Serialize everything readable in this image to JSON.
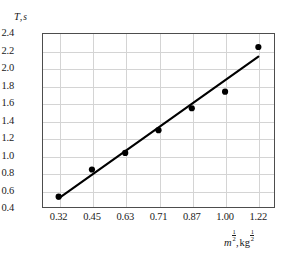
{
  "chart_data": {
    "type": "scatter",
    "title": "",
    "subtitle": "",
    "xlabel": "m^1/2, kg^1/2",
    "ylabel": "T, s",
    "ylabel_parts": {
      "variable": "T",
      "separator": ",",
      "unit": "s"
    },
    "xlabel_parts": {
      "variable": "m",
      "variable_exponent_num": "1",
      "variable_exponent_den": "2",
      "separator": ",",
      "unit": "kg",
      "unit_exponent_num": "1",
      "unit_exponent_den": "2"
    },
    "x": [
      0.32,
      0.45,
      0.63,
      0.71,
      0.87,
      1.0,
      1.22
    ],
    "values": [
      0.53,
      0.84,
      1.03,
      1.29,
      1.54,
      1.73,
      2.24
    ],
    "categories": [
      "0.32",
      "0.45",
      "0.63",
      "0.71",
      "0.87",
      "1.00",
      "1.22"
    ],
    "xtick_labels": [
      "0.32",
      "0.45",
      "0.63",
      "0.71",
      "0.87",
      "1.00",
      "1.22"
    ],
    "ytick_labels": [
      "2.4",
      "2.2",
      "2.0",
      "1.8",
      "1.6",
      "1.4",
      "1.2",
      "1.0",
      "0.8",
      "0.6",
      "0.4"
    ],
    "ylim": [
      0.4,
      2.4
    ],
    "ytick_step": 0.2,
    "x_axis_scale": "categorical-evenly-spaced",
    "grid": true,
    "legend": null,
    "series": [
      {
        "name": "measurements",
        "marker": "filled-circle",
        "marker_color": "#000000",
        "values": [
          0.53,
          0.84,
          1.03,
          1.29,
          1.54,
          1.73,
          2.24
        ]
      },
      {
        "name": "best-fit-line",
        "type": "line",
        "line_color": "#000000",
        "endpoints": [
          {
            "x": 0.32,
            "y": 0.51
          },
          {
            "x": 1.22,
            "y": 2.13
          }
        ]
      }
    ],
    "colors": {
      "marker": "#000000",
      "line": "#000000",
      "grid": "#d4d4d4",
      "frame": "#4d4d4d",
      "background": "#ffffff",
      "text": "#1a1a1a"
    }
  }
}
